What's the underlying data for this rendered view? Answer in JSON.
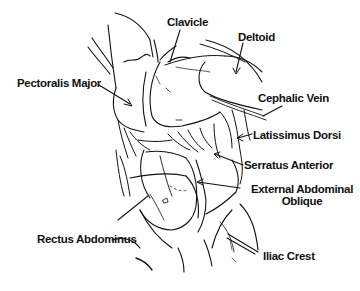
{
  "diagram": {
    "type": "anatomical-line-drawing",
    "colors": {
      "background": "#ffffff",
      "ink": "#111111"
    },
    "labels": {
      "clavicle": "Clavicle",
      "deltoid": "Deltoid",
      "pectoralis_major": "Pectoralis Major",
      "cephalic_vein": "Cephalic Vein",
      "latissimus_dorsi": "Latissimus Dorsi",
      "serratus_anterior": "Serratus Anterior",
      "external_abdominal_oblique_line1": "External Abdominal",
      "external_abdominal_oblique_line2": "Oblique",
      "rectus_abdominus": "Rectus Abdominus",
      "iliac_crest": "Iliac Crest"
    }
  }
}
